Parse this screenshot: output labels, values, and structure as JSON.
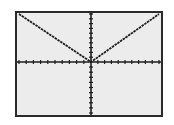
{
  "screen": {
    "type": "graphing-calculator-display",
    "background": "#ececec",
    "ink": "#1e1e1e"
  },
  "chart_data": {
    "type": "line",
    "title": "",
    "function": "y = |x|",
    "xlabel": "",
    "ylabel": "",
    "xlim": [
      -10,
      10
    ],
    "ylim": [
      -10,
      10
    ],
    "x_tick_step": 1,
    "y_tick_step": 1,
    "grid": false,
    "legend": null,
    "series": [
      {
        "name": "y=|x|",
        "x": [
          -10,
          0,
          10
        ],
        "y": [
          10,
          0,
          10
        ]
      }
    ]
  }
}
